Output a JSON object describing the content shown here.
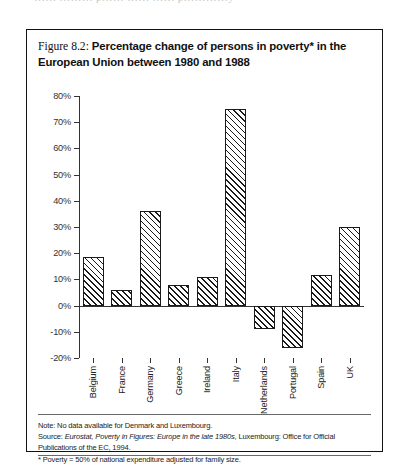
{
  "bleed_text": "……  ……… p…… …… …… p…………y",
  "figure": {
    "label": "Figure 8.2:",
    "title": "Percentage change of persons in poverty* in the European Union between 1980 and 1988",
    "title_line1": "Percentage change of persons in poverty* in the",
    "title_line2": "European Union between 1980 and 1988"
  },
  "notes": {
    "note": "Note: No data available for Denmark and Luxembourg.",
    "source_prefix": "Source:",
    "source_italic": "Eurostat, Poverty in Figures: Europe in the late 1980s,",
    "source_suffix": "Luxembourg: Office for Official Publications of the EC, 1994.",
    "footnote": "* Poverty = 50% of national expenditure adjusted for family size."
  },
  "chart_data": {
    "type": "bar",
    "title": "Percentage change of persons in poverty* in the European Union between 1980 and 1988",
    "xlabel": "",
    "ylabel": "",
    "grid": false,
    "legend": "none",
    "ylim": [
      -20,
      80
    ],
    "ytick_labels": [
      "80%",
      "70%",
      "60%",
      "50%",
      "40%",
      "30%",
      "20%",
      "10%",
      "0%",
      "-10%",
      "-20%"
    ],
    "ytick_values": [
      80,
      70,
      60,
      50,
      40,
      30,
      20,
      10,
      0,
      -10,
      -20
    ],
    "categories": [
      "Belgium",
      "France",
      "Germany",
      "Greece",
      "Ireland",
      "Italy",
      "Netherlands",
      "Portugal",
      "Spain",
      "UK"
    ],
    "values": [
      18.5,
      6,
      36,
      8,
      11,
      75,
      -9,
      -16,
      11.5,
      30
    ],
    "bar_style": {
      "fill": "#ffffff",
      "hatch": "diagonal-45",
      "edge": "#1a1a1a"
    }
  },
  "colors": {
    "border": "#111111",
    "axis": "#333333",
    "text": "#222222",
    "bleed": "#c8c8c8"
  }
}
